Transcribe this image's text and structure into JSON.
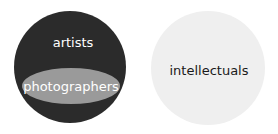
{
  "diagram": {
    "type": "euler",
    "sets": [
      {
        "name": "artists",
        "label": "artists",
        "color": "#2b2b2b",
        "contains": [
          "photographers"
        ]
      },
      {
        "name": "photographers",
        "label": "photographers",
        "color": "#9a9a9a",
        "subset_of": "artists"
      },
      {
        "name": "intellectuals",
        "label": "intellectuals",
        "color": "#efefef",
        "disjoint_with": [
          "artists"
        ]
      }
    ],
    "labels": {
      "artists": "artists",
      "photographers": "photographers",
      "intellectuals": "intellectuals"
    }
  }
}
